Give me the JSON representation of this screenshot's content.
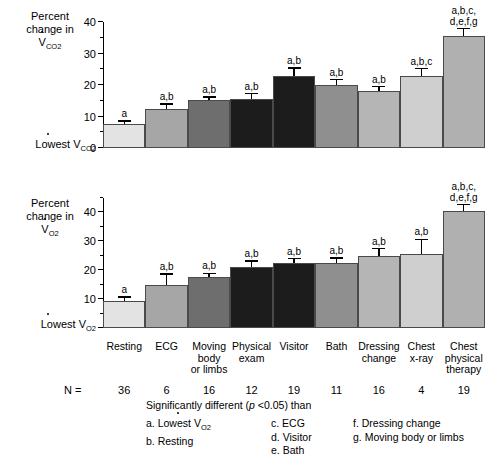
{
  "chart_data": [
    {
      "type": "bar",
      "id": "vco2",
      "title": "Percent change in VCO2",
      "ylabel": "Percent change in V̇CO₂",
      "baseline_label": "Lowest V̇CO₂",
      "ylim": [
        0,
        40
      ],
      "yticks": [
        0,
        10,
        20,
        30,
        40
      ],
      "yticks_minor": [
        5,
        15,
        25,
        35
      ],
      "grid": false,
      "legend": "none",
      "categories": [
        "Resting",
        "ECG",
        "Moving body or limbs",
        "Physical exam",
        "Visitor",
        "Bath",
        "Dressing change",
        "Chest x-ray",
        "Chest physical therapy"
      ],
      "values": [
        7.5,
        12.5,
        15.2,
        15.5,
        23.0,
        20.0,
        18.0,
        23.0,
        35.5
      ],
      "errors": [
        0.8,
        1.3,
        0.8,
        1.5,
        2.2,
        1.5,
        1.3,
        2.0,
        2.2
      ],
      "annotations": [
        "a",
        "a,b",
        "a,b",
        "a,b",
        "a,b",
        "a,b",
        "a,b",
        "a,b,c",
        "a,b,c,\nd,e,f,g"
      ],
      "bar_colors": [
        "#e3e3e3",
        "#a6a6a6",
        "#6e6e6e",
        "#1c1c1c",
        "#1c1c1c",
        "#8f8f8f",
        "#b5b5b5",
        "#cfcfcf",
        "#b0b0b0"
      ]
    },
    {
      "type": "bar",
      "id": "vo2",
      "title": "Percent change in VO2",
      "ylabel": "Percent change in V̇O₂",
      "baseline_label": "Lowest V̇O₂",
      "ylim": [
        0,
        45
      ],
      "yticks": [
        10,
        20,
        30,
        40
      ],
      "yticks_minor": [
        5,
        15,
        25,
        35,
        45
      ],
      "grid": false,
      "legend": "none",
      "categories": [
        "Resting",
        "ECG",
        "Moving body or limbs",
        "Physical exam",
        "Visitor",
        "Bath",
        "Dressing change",
        "Chest x-ray",
        "Chest physical therapy"
      ],
      "values": [
        9.5,
        15.0,
        17.5,
        21.0,
        22.5,
        22.5,
        25.0,
        25.5,
        40.5
      ],
      "errors": [
        1.0,
        3.5,
        1.2,
        2.0,
        1.3,
        1.5,
        2.2,
        5.0,
        2.0
      ],
      "annotations": [
        "a",
        "a,b",
        "a,b",
        "a,b",
        "a,b",
        "a,b",
        "a,b",
        "a,b",
        "a,b,c,\nd,e,f,g"
      ],
      "bar_colors": [
        "#e3e3e3",
        "#a6a6a6",
        "#6e6e6e",
        "#1c1c1c",
        "#1c1c1c",
        "#8f8f8f",
        "#b5b5b5",
        "#cfcfcf",
        "#b0b0b0"
      ]
    }
  ],
  "axis_titles": {
    "top_line1": "Percent",
    "top_line2": "change in",
    "top_symbol_v": "V",
    "top_symbol_sub": "CO",
    "top_symbol_sub2": "2",
    "bottom_line1": "Percent",
    "bottom_line2": "change in",
    "bottom_symbol_v": "V",
    "bottom_symbol_sub": "O",
    "bottom_symbol_sub2": "2"
  },
  "baselines": {
    "top_prefix": "Lowest",
    "top_v": "V",
    "top_sub": "CO",
    "top_sub2": "2",
    "bottom_prefix": "Lowest",
    "bottom_v": "V",
    "bottom_sub": "O",
    "bottom_sub2": "2"
  },
  "categories": [
    {
      "lines": [
        "Resting"
      ],
      "n": "36"
    },
    {
      "lines": [
        "ECG"
      ],
      "n": "6"
    },
    {
      "lines": [
        "Moving",
        "body",
        "or limbs"
      ],
      "n": "16"
    },
    {
      "lines": [
        "Physical",
        "exam"
      ],
      "n": "12"
    },
    {
      "lines": [
        "Visitor"
      ],
      "n": "19"
    },
    {
      "lines": [
        "Bath"
      ],
      "n": "11"
    },
    {
      "lines": [
        "Dressing",
        "change"
      ],
      "n": "16"
    },
    {
      "lines": [
        "Chest",
        "x-ray"
      ],
      "n": "4"
    },
    {
      "lines": [
        "Chest",
        "physical",
        "therapy"
      ],
      "n": "19"
    }
  ],
  "n_label": "N =",
  "footnote": {
    "heading_pre": "Significantly different (",
    "heading_italic": "p",
    "heading_post": " <0.05) than",
    "col1": [
      {
        "key": "a.",
        "text_pre": "Lowest ",
        "text_v": "V",
        "text_sub": "O",
        "text_sub2": "2"
      },
      {
        "key": "b.",
        "text": "Resting"
      }
    ],
    "col2": [
      {
        "key": "c.",
        "text": "ECG"
      },
      {
        "key": "d.",
        "text": "Visitor"
      },
      {
        "key": "e.",
        "text": "Bath"
      }
    ],
    "col3": [
      {
        "key": "f.",
        "text": "Dressing change"
      },
      {
        "key": "g.",
        "text": "Moving body or limbs"
      }
    ]
  },
  "colors": {
    "axis": "#000000",
    "background": "#ffffff",
    "bar_edge": "#4a4a4a"
  }
}
